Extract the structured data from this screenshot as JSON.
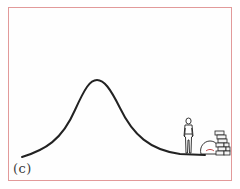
{
  "figure": {
    "panel_label": "(c)",
    "frame_color": "#e29a9a",
    "curve_color": "#222222",
    "elements": [
      {
        "name": "hump-curve",
        "description": "bell-shaped curve peaking near upper-middle"
      },
      {
        "name": "person",
        "description": "standing figure on the flat tail at right"
      },
      {
        "name": "sack",
        "description": "rounded sack/bag on ground"
      },
      {
        "name": "brick-stack",
        "description": "stacked bricks at far right"
      }
    ]
  }
}
